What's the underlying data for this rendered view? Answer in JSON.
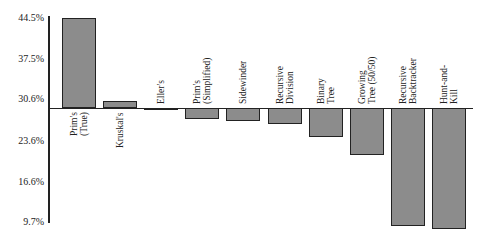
{
  "chart_data": {
    "type": "bar",
    "title": "",
    "xlabel": "",
    "ylabel": "",
    "baseline": 29.1,
    "ylim": [
      9.7,
      44.5
    ],
    "yticks": [
      "44.5%",
      "37.5%",
      "30.6%",
      "23.6%",
      "16.6%",
      "9.7%"
    ],
    "ytick_values": [
      44.5,
      37.5,
      30.6,
      23.6,
      16.6,
      9.7
    ],
    "grid": false,
    "categories": [
      "Prim's (True)",
      "Kruskal's",
      "Eller's",
      "Prim's (Simplified)",
      "Sidewinder",
      "Recursive Division",
      "Binary Tree",
      "Growing Tree (50/50)",
      "Recursive Backtracker",
      "Hunt-and-Kill"
    ],
    "label_lines": [
      [
        "Prim's",
        "(True)"
      ],
      [
        "Kruskal's"
      ],
      [
        "Eller's"
      ],
      [
        "Prim's",
        "(Simplified)"
      ],
      [
        "Sidewinder"
      ],
      [
        "Recursive",
        "Division"
      ],
      [
        "Binary",
        "Tree"
      ],
      [
        "Growing",
        "Tree (50/50)"
      ],
      [
        "Recursive",
        "Backtracker"
      ],
      [
        "Hunt-and-",
        "Kill"
      ]
    ],
    "values": [
      44.5,
      30.3,
      28.8,
      27.3,
      26.9,
      26.4,
      24.2,
      21.1,
      9.0,
      8.5
    ],
    "bar_color": "#8c8c8c"
  }
}
